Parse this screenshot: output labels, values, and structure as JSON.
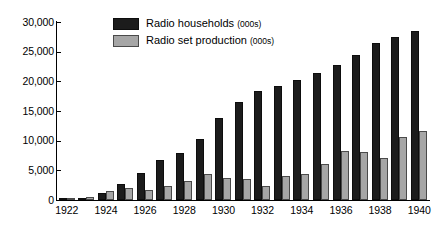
{
  "chart_data": {
    "type": "bar",
    "title": "",
    "xlabel": "",
    "ylabel": "",
    "ylim": [
      0,
      30000
    ],
    "ytick_labels": [
      "30,000",
      "25,000",
      "20,000",
      "15,000",
      "10,000",
      "5,000",
      "0"
    ],
    "ytick_values": [
      30000,
      25000,
      20000,
      15000,
      10000,
      5000,
      0
    ],
    "grid": false,
    "legend_position": "top-left",
    "categories": [
      "1922",
      "1923",
      "1924",
      "1925",
      "1926",
      "1927",
      "1928",
      "1929",
      "1930",
      "1931",
      "1932",
      "1933",
      "1934",
      "1935",
      "1936",
      "1937",
      "1938",
      "1939",
      "1940"
    ],
    "visible_xtick_labels": [
      "1922",
      "1924",
      "1926",
      "1928",
      "1930",
      "1932",
      "1934",
      "1936",
      "1938",
      "1940"
    ],
    "series": [
      {
        "name": "Radio households",
        "unit": "(000s)",
        "color": "#1c1c1c",
        "values": [
          60,
          400,
          1250,
          2750,
          4500,
          6750,
          8000,
          10250,
          13750,
          16600,
          18400,
          19200,
          20300,
          21400,
          22800,
          24400,
          26500,
          27400,
          28500
        ]
      },
      {
        "name": "Radio set production",
        "unit": "(000s)",
        "color": "#a6a6a6",
        "values": [
          100,
          500,
          1500,
          2000,
          1750,
          2300,
          3200,
          4400,
          3750,
          3500,
          2400,
          4100,
          4400,
          6000,
          8200,
          8050,
          7100,
          10700,
          11700
        ]
      }
    ]
  }
}
